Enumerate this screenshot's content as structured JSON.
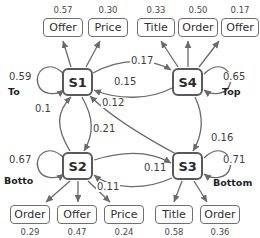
{
  "diagram": {
    "type": "state-transition-diagram",
    "states": [
      {
        "id": "S1",
        "label": "S1",
        "x": 62,
        "y": 68,
        "w": 31,
        "h": 28,
        "self_loop_prob": "0.59",
        "self_loop_label": "To",
        "emissions": [
          {
            "label": "Offer",
            "value": "0.57"
          },
          {
            "label": "Price",
            "value": "0.30"
          }
        ]
      },
      {
        "id": "S4",
        "label": "S4",
        "x": 172,
        "y": 68,
        "w": 31,
        "h": 28,
        "self_loop_prob": "0.65",
        "self_loop_label": "Top",
        "emissions": [
          {
            "label": "Title",
            "value": "0.33"
          },
          {
            "label": "Order",
            "value": "0.50"
          },
          {
            "label": "Offer",
            "value": "0.17"
          }
        ]
      },
      {
        "id": "S2",
        "label": "S2",
        "x": 62,
        "y": 152,
        "w": 31,
        "h": 28,
        "self_loop_prob": "0.67",
        "self_loop_label": "Botto",
        "emissions": [
          {
            "label": "Order",
            "value": "0.29"
          },
          {
            "label": "Offer",
            "value": "0.47"
          },
          {
            "label": "Price",
            "value": "0.24"
          }
        ]
      },
      {
        "id": "S3",
        "label": "S3",
        "x": 172,
        "y": 152,
        "w": 31,
        "h": 28,
        "self_loop_prob": "0.71",
        "self_loop_label": "Bottom",
        "emissions": [
          {
            "label": "Title",
            "value": "0.58"
          },
          {
            "label": "Order",
            "value": "0.36"
          }
        ]
      }
    ],
    "transitions": [
      {
        "from": "S1",
        "to": "S4",
        "prob": "0.17"
      },
      {
        "from": "S4",
        "to": "S1",
        "prob": "0.15"
      },
      {
        "from": "S3",
        "to": "S1",
        "prob": "0.12"
      },
      {
        "from": "S2",
        "to": "S1",
        "prob": "0.1"
      },
      {
        "from": "S1",
        "to": "S2",
        "prob": "0.21"
      },
      {
        "from": "S4",
        "to": "S3",
        "prob": "0.16"
      },
      {
        "from": "S2",
        "to": "S3",
        "prob": "0.11"
      },
      {
        "from": "S3",
        "to": "S2",
        "prob": "0.11"
      }
    ],
    "emission_boxes_top": [
      {
        "label": "Offer",
        "value": "0.57",
        "x": 43,
        "y": 18,
        "w": 40,
        "h": 19
      },
      {
        "label": "Price",
        "value": "0.30",
        "x": 88,
        "y": 18,
        "w": 40,
        "h": 19
      },
      {
        "label": "Title",
        "value": "0.33",
        "x": 137,
        "y": 18,
        "w": 38,
        "h": 19
      },
      {
        "label": "Order",
        "value": "0.50",
        "x": 178,
        "y": 18,
        "w": 40,
        "h": 19
      },
      {
        "label": "Offer",
        "value": "0.17",
        "x": 221,
        "y": 18,
        "w": 38,
        "h": 19
      }
    ],
    "emission_boxes_bottom": [
      {
        "label": "Order",
        "value": "0.29",
        "x": 10,
        "y": 205,
        "w": 40,
        "h": 19
      },
      {
        "label": "Offer",
        "value": "0.47",
        "x": 57,
        "y": 205,
        "w": 40,
        "h": 19
      },
      {
        "label": "Price",
        "value": "0.24",
        "x": 104,
        "y": 205,
        "w": 40,
        "h": 19
      },
      {
        "label": "Title",
        "value": "0.58",
        "x": 155,
        "y": 205,
        "w": 38,
        "h": 19
      },
      {
        "label": "Order",
        "value": "0.36",
        "x": 200,
        "y": 205,
        "w": 40,
        "h": 19
      }
    ],
    "self_loop_labels": [
      {
        "prob": "0.59",
        "name": "To",
        "px": 8,
        "py": 72,
        "nx": 8,
        "ny": 87
      },
      {
        "prob": "0.65",
        "name": "Top",
        "px": 222,
        "py": 72,
        "nx": 222,
        "ny": 87
      },
      {
        "prob": "0.67",
        "name": "Botto",
        "px": 8,
        "py": 155,
        "nx": 4,
        "ny": 176
      },
      {
        "prob": "0.71",
        "name": "Bottom",
        "px": 222,
        "py": 155,
        "nx": 213,
        "ny": 178
      }
    ],
    "edge_labels": [
      {
        "prob": "0.17",
        "x": 130,
        "y": 56
      },
      {
        "prob": "0.15",
        "x": 113,
        "y": 77
      },
      {
        "prob": "0.12",
        "x": 101,
        "y": 98
      },
      {
        "prob": "0.1",
        "x": 34,
        "y": 104
      },
      {
        "prob": "0.21",
        "x": 92,
        "y": 124
      },
      {
        "prob": "0.16",
        "x": 210,
        "y": 133
      },
      {
        "prob": "0.11",
        "x": 143,
        "y": 163
      },
      {
        "prob": "0.11",
        "x": 96,
        "y": 182
      }
    ],
    "colors": {
      "state_border": "#5a5a5a",
      "emit_border": "#6f6f6f",
      "edge": "#6a6a6a",
      "text": "#2f2f2f",
      "background": "#ffffff"
    }
  }
}
